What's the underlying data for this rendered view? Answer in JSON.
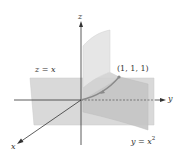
{
  "diagram": {
    "type": "3d-surface-intersection",
    "axes": {
      "x": {
        "label": "x"
      },
      "y": {
        "label": "y"
      },
      "z": {
        "label": "z"
      }
    },
    "surfaces": [
      {
        "name": "plane",
        "equation_lhs": "z",
        "equation_rhs": "x",
        "label": "z = x"
      },
      {
        "name": "parabolic-cylinder",
        "equation_lhs": "y",
        "equation_rhs": "x",
        "exponent": "2",
        "label": "y = x²"
      }
    ],
    "point": {
      "label": "(1, 1, 1)",
      "coords": [
        1,
        1,
        1
      ]
    },
    "colors": {
      "plane_fill": "#d8d8d8",
      "cylinder_fill_light": "#e4e4e4",
      "cylinder_fill_dark": "#c4c4c4",
      "curve": "#8a8a8a",
      "axis": "#333333",
      "dashed": "#555555"
    }
  }
}
